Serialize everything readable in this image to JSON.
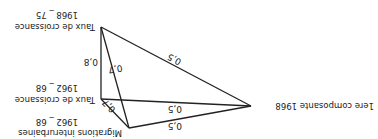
{
  "diagram": {
    "orientation": "rotated-180",
    "nodes": {
      "growth_6875": {
        "line1": "Taux de croissance",
        "line2": "1968 _ 75"
      },
      "growth_6268": {
        "line1": "Taux de croissance",
        "line2": "1962 _ 68"
      },
      "migrations_6268": {
        "line1": "Migrations interurbaines",
        "line2": "1962 _ 68"
      },
      "component_1968": {
        "label": "1ere composante 1968"
      }
    },
    "edges": {
      "growth6875_growth6268": "0,8",
      "growth6875_migrations": "0,7",
      "growth6875_component": "0,5",
      "growth6268_component": "0,5",
      "growth6268_migrations": "0,7",
      "migrations_component": "0,5"
    }
  }
}
